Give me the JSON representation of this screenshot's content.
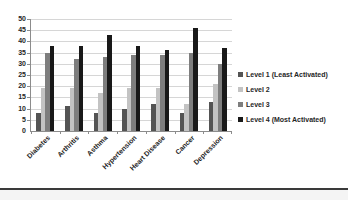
{
  "chart_data": {
    "type": "bar",
    "title": "",
    "xlabel": "",
    "ylabel": "",
    "categories": [
      "Diabetes",
      "Arthritis",
      "Asthma",
      "Hypertension",
      "Heart Disease",
      "Cancer",
      "Depression"
    ],
    "series": [
      {
        "name": "Level 1 (Least Activated)",
        "color": "#545454",
        "values": [
          8,
          11,
          8,
          10,
          12,
          8,
          13
        ]
      },
      {
        "name": "Level 2",
        "color": "#c3c3c3",
        "values": [
          19,
          19,
          17,
          19,
          19,
          12,
          21
        ]
      },
      {
        "name": "Level 3",
        "color": "#7e7e7e",
        "values": [
          35,
          32,
          33,
          34,
          34,
          35,
          30
        ]
      },
      {
        "name": "Level 4 (Most Activated)",
        "color": "#191919",
        "values": [
          38,
          38,
          43,
          38,
          36,
          46,
          37
        ]
      }
    ],
    "ylim": [
      0,
      50
    ],
    "yticks": [
      0,
      5,
      10,
      15,
      20,
      25,
      30,
      35,
      40,
      45,
      50
    ],
    "grid": true,
    "legend_position": "right"
  },
  "colors": {
    "gridline": "#d6d6d6",
    "axis": "#8c8c8c",
    "label_text": "#262626",
    "background": "#ffffff",
    "bottom_divider": "#3a3a3a",
    "below_divider": "#f4f4f4"
  }
}
